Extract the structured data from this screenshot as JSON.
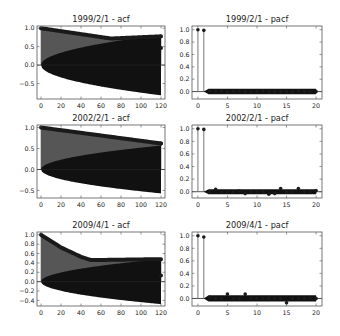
{
  "figure": {
    "width": 340,
    "height": 336,
    "background": "#ffffff",
    "stem_color": "#1a1a1a",
    "marker_color": "#1a1a1a",
    "band_color": "#111111",
    "axis_color": "#555555"
  },
  "chart_data": [
    {
      "type": "stem",
      "title": "1999/2/1 - acf",
      "frame": {
        "x0": 37,
        "y0": 26,
        "x1": 165,
        "y1": 99
      },
      "xlim": [
        -4,
        124
      ],
      "ylim": [
        -0.92,
        1.06
      ],
      "xticks": [
        0,
        20,
        40,
        60,
        80,
        100,
        120
      ],
      "yticks": [
        1.0,
        0.5,
        0.0,
        -0.5
      ],
      "ytick_labels": [
        "1.0",
        "0.5",
        "0.0",
        "−0.5"
      ],
      "nlags": 120,
      "values_knots": [
        [
          0,
          1.0
        ],
        [
          70,
          0.72
        ],
        [
          120,
          0.46
        ]
      ],
      "upper_edge": [
        [
          0,
          1.0
        ],
        [
          70,
          0.72
        ],
        [
          120,
          0.78
        ]
      ],
      "confint_at_end": 0.82
    },
    {
      "type": "stem",
      "title": "1999/2/1 - pacf",
      "frame": {
        "x0": 192,
        "y0": 26,
        "x1": 322,
        "y1": 99
      },
      "xlim": [
        -1,
        21
      ],
      "ylim": [
        -0.12,
        1.06
      ],
      "xticks": [
        0,
        5,
        10,
        15,
        20
      ],
      "yticks": [
        1.0,
        0.8,
        0.6,
        0.4,
        0.2,
        0.0
      ],
      "ytick_labels": [
        "1.0",
        "0.8",
        "0.6",
        "0.4",
        "0.2",
        "0.0"
      ],
      "nlags": 20,
      "values": [
        1.0,
        0.99,
        0.01,
        0.0,
        0.01,
        0.0,
        0.0,
        0.01,
        0.0,
        0.0,
        0.0,
        0.01,
        0.0,
        0.0,
        0.0,
        0.0,
        0.0,
        0.01,
        0.0,
        0.0,
        0.0
      ],
      "confint": 0.045
    },
    {
      "type": "stem",
      "title": "2002/2/1 - acf",
      "frame": {
        "x0": 37,
        "y0": 125,
        "x1": 165,
        "y1": 198
      },
      "xlim": [
        -4,
        124
      ],
      "ylim": [
        -0.68,
        1.06
      ],
      "xticks": [
        0,
        20,
        40,
        60,
        80,
        100,
        120
      ],
      "yticks": [
        1.0,
        0.5,
        0.0,
        -0.5
      ],
      "ytick_labels": [
        "1.0",
        "0.5",
        "0.0",
        "−0.5"
      ],
      "nlags": 120,
      "values_knots": [
        [
          0,
          1.0
        ],
        [
          120,
          0.62
        ]
      ],
      "upper_edge": [
        [
          0,
          1.0
        ],
        [
          120,
          0.62
        ]
      ],
      "confint_at_end": 0.57
    },
    {
      "type": "stem",
      "title": "2002/2/1 - pacf",
      "frame": {
        "x0": 192,
        "y0": 125,
        "x1": 322,
        "y1": 198
      },
      "xlim": [
        -1,
        21
      ],
      "ylim": [
        -0.1,
        1.06
      ],
      "xticks": [
        0,
        5,
        10,
        15,
        20
      ],
      "yticks": [
        1.0,
        0.8,
        0.6,
        0.4,
        0.2,
        0.0
      ],
      "ytick_labels": [
        "1.0",
        "0.8",
        "0.6",
        "0.4",
        "0.2",
        "0.0"
      ],
      "nlags": 20,
      "values": [
        1.0,
        0.99,
        0.0,
        0.04,
        0.0,
        0.0,
        0.0,
        0.01,
        -0.03,
        0.0,
        0.0,
        0.0,
        -0.04,
        -0.03,
        0.05,
        0.0,
        0.0,
        0.05,
        0.0,
        0.0,
        0.02
      ],
      "confint": 0.04
    },
    {
      "type": "stem",
      "title": "2009/4/1 - acf",
      "frame": {
        "x0": 37,
        "y0": 232,
        "x1": 165,
        "y1": 306
      },
      "xlim": [
        -4,
        124
      ],
      "ylim": [
        -0.52,
        1.06
      ],
      "xticks": [
        0,
        20,
        40,
        60,
        80,
        100,
        120
      ],
      "yticks": [
        1.0,
        0.8,
        0.6,
        0.4,
        0.2,
        0.0,
        -0.2,
        -0.4
      ],
      "ytick_labels": [
        "1.0",
        "0.8",
        "0.6",
        "0.4",
        "0.2",
        "0.0",
        "−0.2",
        "−0.4"
      ],
      "nlags": 120,
      "values_knots": [
        [
          0,
          1.0
        ],
        [
          20,
          0.73
        ],
        [
          40,
          0.53
        ],
        [
          50,
          0.46
        ],
        [
          120,
          0.13
        ]
      ],
      "upper_edge": [
        [
          0,
          1.0
        ],
        [
          20,
          0.73
        ],
        [
          40,
          0.53
        ],
        [
          50,
          0.46
        ],
        [
          118,
          0.48
        ]
      ],
      "confint_at_end": 0.48
    },
    {
      "type": "stem",
      "title": "2009/4/1 - pacf",
      "frame": {
        "x0": 192,
        "y0": 232,
        "x1": 322,
        "y1": 306
      },
      "xlim": [
        -1,
        21
      ],
      "ylim": [
        -0.12,
        1.06
      ],
      "xticks": [
        0,
        5,
        10,
        15,
        20
      ],
      "yticks": [
        1.0,
        0.8,
        0.6,
        0.4,
        0.2,
        0.0
      ],
      "ytick_labels": [
        "1.0",
        "0.8",
        "0.6",
        "0.4",
        "0.2",
        "0.0"
      ],
      "nlags": 20,
      "values": [
        1.0,
        0.98,
        0.02,
        0.0,
        0.0,
        0.07,
        0.0,
        0.0,
        0.07,
        0.0,
        0.0,
        0.0,
        0.0,
        0.0,
        0.0,
        -0.07,
        0.0,
        0.0,
        0.0,
        0.0,
        0.0
      ],
      "confint": 0.05
    }
  ]
}
